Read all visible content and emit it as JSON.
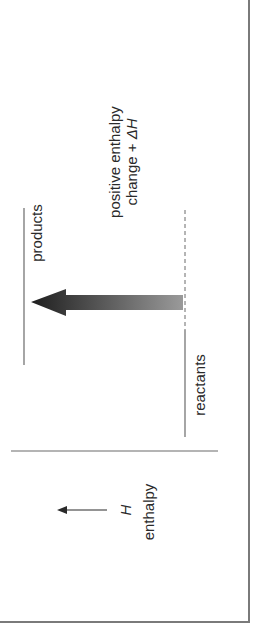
{
  "diagram": {
    "orientation": "rotated 90 degrees counter-clockwise",
    "levels": {
      "products": {
        "label": "products"
      },
      "reactants": {
        "label": "reactants"
      }
    },
    "change_label": {
      "line1": "positive enthalpy",
      "line2_prefix": "change + ",
      "line2_symbol": "ΔH"
    },
    "axis": {
      "symbol": "H",
      "label": "enthalpy"
    },
    "colors": {
      "line": "#6a6a6a",
      "arrow_dark": "#1e1e1e",
      "arrow_light": "#9a9a9a",
      "frame": "#7a7a7a"
    }
  }
}
